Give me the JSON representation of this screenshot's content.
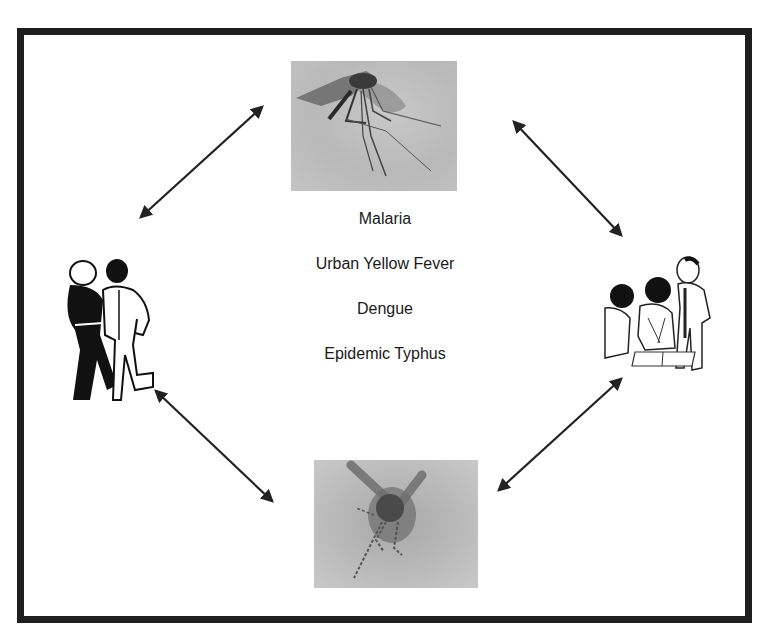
{
  "diagram": {
    "center_labels": [
      "Malaria",
      "Urban Yellow Fever",
      "Dengue",
      "Epidemic Typhus"
    ],
    "nodes": [
      {
        "id": "top",
        "kind": "photo",
        "subject": "mosquito-photo-top"
      },
      {
        "id": "right",
        "kind": "illustration",
        "subject": "children-group-illustration"
      },
      {
        "id": "bottom",
        "kind": "photo",
        "subject": "mosquito-photo-bottom"
      },
      {
        "id": "left",
        "kind": "illustration",
        "subject": "people-walking-illustration"
      }
    ],
    "edges": [
      {
        "from": "left",
        "to": "top",
        "type": "bidirectional"
      },
      {
        "from": "top",
        "to": "right",
        "type": "bidirectional"
      },
      {
        "from": "right",
        "to": "bottom",
        "type": "bidirectional"
      },
      {
        "from": "bottom",
        "to": "left",
        "type": "bidirectional"
      }
    ],
    "colors": {
      "frame": "#1e1e1e",
      "arrow": "#222222",
      "text": "#1a1a1a",
      "background": "#ffffff"
    }
  }
}
